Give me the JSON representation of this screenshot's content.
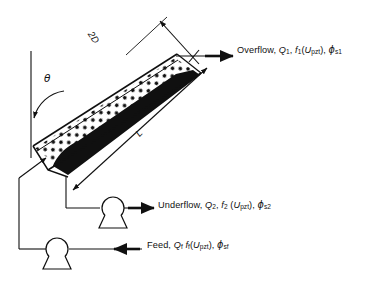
{
  "figure": {
    "type": "process-schematic",
    "background_color": "#ffffff",
    "line_color": "#101010"
  },
  "streams": {
    "overflow": {
      "name": "Overflow",
      "flow_symbol": "Q",
      "flow_subscript": "1",
      "function_symbol": "f",
      "function_subscript": "1",
      "function_argument": "U",
      "function_argument_subscript": "pzt",
      "fraction_symbol": "ϕ",
      "fraction_subscript": "s1",
      "text": "Overflow, Q1, f1(Upzt), ϕs1"
    },
    "underflow": {
      "name": "Underflow",
      "flow_symbol": "Q",
      "flow_subscript": "2",
      "function_symbol": "f",
      "function_subscript": "2",
      "function_argument": "U",
      "function_argument_subscript": "pzt",
      "fraction_symbol": "ϕ",
      "fraction_subscript": "s2",
      "text": "Underflow, Q2, f2 (Upzt), ϕs2"
    },
    "feed": {
      "name": "Feed",
      "flow_symbol": "Q",
      "flow_subscript": "f",
      "function_symbol": "f",
      "function_subscript": "f",
      "function_argument": "U",
      "function_argument_subscript": "pzt",
      "fraction_symbol": "ϕ",
      "fraction_subscript": "sf",
      "text": "Feed, Qf, ff(Upzt), ϕsf"
    }
  },
  "dimensions": {
    "width": "2D",
    "length": "L",
    "angle": "θ"
  },
  "equipment": {
    "channel": "inclined-settling-channel",
    "suspension_region": "dotted-suspension",
    "sediment_layer": "solid-black-sediment",
    "underflow_pump": "pump",
    "feed_pump": "pump"
  }
}
